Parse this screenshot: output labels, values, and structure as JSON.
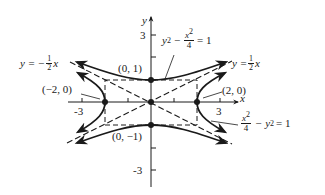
{
  "figure": {
    "type": "hyperbola-graph",
    "axes": {
      "x_label": "x",
      "y_label": "y",
      "x_ticks": [
        "-3",
        "3"
      ],
      "y_ticks": [
        "3",
        "-3"
      ]
    },
    "points": [
      {
        "label": "(0, 1)",
        "x": 0,
        "y": 1
      },
      {
        "label": "(0, −1)",
        "x": 0,
        "y": -1
      },
      {
        "label": "(−2, 0)",
        "x": -2,
        "y": 0
      },
      {
        "label": "(2, 0)",
        "x": 2,
        "y": 0
      },
      {
        "label": "",
        "x": 0,
        "y": 0
      }
    ],
    "equations": {
      "hyperbola_vertical": {
        "lhs_a": "y",
        "lhs_a_exp": "2",
        "minus": "−",
        "frac_num": "x",
        "frac_num_exp": "2",
        "frac_den": "4",
        "rhs": "= 1"
      },
      "hyperbola_horizontal": {
        "frac_num": "x",
        "frac_num_exp": "2",
        "frac_den": "4",
        "minus": "− y",
        "minus_exp": "2",
        "rhs": "= 1"
      },
      "asymptote_pos": {
        "lhs": "y =",
        "frac_num": "1",
        "frac_den": "2",
        "var": "x"
      },
      "asymptote_neg": {
        "lhs": "y = −",
        "frac_num": "1",
        "frac_den": "2",
        "var": "x"
      }
    },
    "colors": {
      "ink": "#1a1a1a",
      "background": "#ffffff"
    }
  }
}
